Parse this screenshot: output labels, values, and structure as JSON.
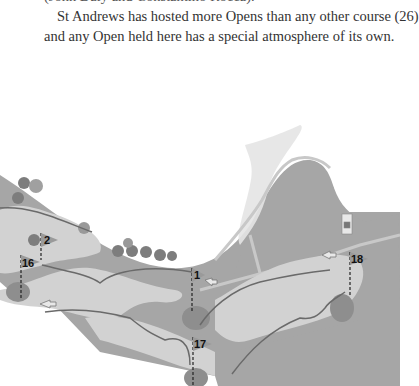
{
  "text": {
    "cut_line": "(John Daly and Constantino Rocca).",
    "para_line1": "St Andrews has hosted more Opens than any other course (26)",
    "para_line2": "and any Open held here has a special atmosphere of its own."
  },
  "map": {
    "title": "St Andrews course map (partial)",
    "holes": [
      {
        "number": "2"
      },
      {
        "number": "16"
      },
      {
        "number": "1"
      },
      {
        "number": "17"
      },
      {
        "number": "18"
      }
    ],
    "colors": {
      "rough": "#a6a6a6",
      "fairway": "#d2d2d2",
      "green": "#8e8e8e",
      "road": "#c4c4c4",
      "trees": "#7d7d7d",
      "path": "#6a6a6a"
    }
  }
}
